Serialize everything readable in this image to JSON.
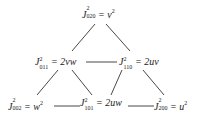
{
  "nodes": [
    {
      "id": "J020",
      "symbol": "J",
      "sup": "2",
      "sub": "020",
      "rhs": "= v",
      "rhs_sup": "2"
    },
    {
      "id": "J011",
      "symbol": "J",
      "sup": "2",
      "sub": "011",
      "rhs": "= 2vw",
      "rhs_sup": ""
    },
    {
      "id": "J110",
      "symbol": "J",
      "sup": "2",
      "sub": "110",
      "rhs": "= 2uv",
      "rhs_sup": ""
    },
    {
      "id": "J002",
      "symbol": "J",
      "sup": "2",
      "sub": "002",
      "rhs": "= w",
      "rhs_sup": "2"
    },
    {
      "id": "J101",
      "symbol": "J",
      "sup": "2",
      "sub": "101",
      "rhs": "= 2uw",
      "rhs_sup": ""
    },
    {
      "id": "J200",
      "symbol": "J",
      "sup": "2",
      "sub": "200",
      "rhs": "= u",
      "rhs_sup": "2"
    }
  ],
  "edges": [
    {
      "from": "J020",
      "to": "J011"
    },
    {
      "from": "J020",
      "to": "J110"
    },
    {
      "from": "J011",
      "to": "J110"
    },
    {
      "from": "J011",
      "to": "J002"
    },
    {
      "from": "J011",
      "to": "J101"
    },
    {
      "from": "J110",
      "to": "J101"
    },
    {
      "from": "J110",
      "to": "J200"
    },
    {
      "from": "J002",
      "to": "J101"
    },
    {
      "from": "J101",
      "to": "J200"
    }
  ],
  "colors": {
    "line": "#333333",
    "text": "#222222"
  }
}
